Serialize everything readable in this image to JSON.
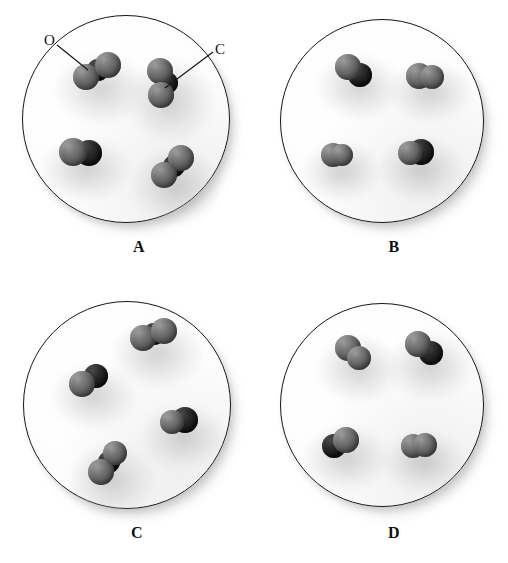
{
  "figure": {
    "type": "molecular-model-diagram",
    "background_color": "#ffffff",
    "vessel_border_color": "#16161a",
    "atom_colors": {
      "O": "#6e6e6e",
      "C": "#141414"
    },
    "atom_legend": [
      {
        "key": "O",
        "label": "O",
        "element": "oxygen",
        "color": "#6e6e6e"
      },
      {
        "key": "C",
        "label": "C",
        "element": "carbon",
        "color": "#141414"
      }
    ],
    "panels": [
      {
        "id": "A",
        "label": "A",
        "label_x": 124,
        "label_y": 238,
        "circle": {
          "cx": 125,
          "cy": 118,
          "r": 103
        },
        "callouts": [
          {
            "id": "callout-o",
            "text": "O",
            "text_x": 44,
            "text_y": 32,
            "line": {
              "x1": 57,
              "y1": 45,
              "x2": 88,
              "y2": 70
            }
          },
          {
            "id": "callout-c",
            "text": "C",
            "text_x": 215,
            "text_y": 41,
            "line": {
              "x1": 213,
              "y1": 52,
              "x2": 165,
              "y2": 88
            }
          }
        ],
        "molecules": [
          {
            "id": "A1",
            "formula": "CO2",
            "x": 72,
            "y": 52,
            "w": 50,
            "h": 42,
            "atoms": [
              {
                "el": "O",
                "cx": 14,
                "cy": 25,
                "r": 13
              },
              {
                "el": "C",
                "cx": 26,
                "cy": 18,
                "r": 11
              },
              {
                "el": "O",
                "cx": 36,
                "cy": 13,
                "r": 13
              }
            ]
          },
          {
            "id": "A2",
            "formula": "CO2",
            "x": 143,
            "y": 58,
            "w": 46,
            "h": 54,
            "atoms": [
              {
                "el": "O",
                "cx": 17,
                "cy": 13,
                "r": 13
              },
              {
                "el": "C",
                "cx": 24,
                "cy": 25,
                "r": 11
              },
              {
                "el": "O",
                "cx": 18,
                "cy": 37,
                "r": 13
              }
            ]
          },
          {
            "id": "A3",
            "formula": "CO",
            "x": 58,
            "y": 136,
            "w": 48,
            "h": 34,
            "atoms": [
              {
                "el": "O",
                "cx": 15,
                "cy": 16,
                "r": 14
              },
              {
                "el": "C",
                "cx": 31,
                "cy": 17,
                "r": 13
              }
            ]
          },
          {
            "id": "A4",
            "formula": "CO2",
            "x": 148,
            "y": 146,
            "w": 48,
            "h": 48,
            "atoms": [
              {
                "el": "O",
                "cx": 16,
                "cy": 29,
                "r": 13
              },
              {
                "el": "C",
                "cx": 26,
                "cy": 20,
                "r": 11
              },
              {
                "el": "O",
                "cx": 33,
                "cy": 12,
                "r": 13
              }
            ]
          }
        ]
      },
      {
        "id": "B",
        "label": "B",
        "label_x": 379,
        "label_y": 238,
        "circle": {
          "cx": 381,
          "cy": 120,
          "r": 101
        },
        "callouts": [],
        "molecules": [
          {
            "id": "B1",
            "formula": "CO",
            "x": 334,
            "y": 53,
            "w": 42,
            "h": 36,
            "atoms": [
              {
                "el": "O",
                "cx": 14,
                "cy": 14,
                "r": 13
              },
              {
                "el": "C",
                "cx": 26,
                "cy": 22,
                "r": 12
              }
            ]
          },
          {
            "id": "B2",
            "formula": "O2",
            "x": 405,
            "y": 60,
            "w": 42,
            "h": 32,
            "atoms": [
              {
                "el": "O",
                "cx": 14,
                "cy": 16,
                "r": 13
              },
              {
                "el": "O",
                "cx": 27,
                "cy": 17,
                "r": 12
              }
            ]
          },
          {
            "id": "B3",
            "formula": "O2",
            "x": 320,
            "y": 140,
            "w": 36,
            "h": 30,
            "atoms": [
              {
                "el": "O",
                "cx": 13,
                "cy": 15,
                "r": 12
              },
              {
                "el": "O",
                "cx": 22,
                "cy": 15,
                "r": 11
              }
            ]
          },
          {
            "id": "B4",
            "formula": "CO",
            "x": 396,
            "y": 136,
            "w": 42,
            "h": 34,
            "atoms": [
              {
                "el": "O",
                "cx": 14,
                "cy": 17,
                "r": 12
              },
              {
                "el": "C",
                "cx": 25,
                "cy": 16,
                "r": 13
              }
            ]
          }
        ]
      },
      {
        "id": "C",
        "label": "C",
        "label_x": 122,
        "label_y": 524,
        "circle": {
          "cx": 126,
          "cy": 404,
          "r": 103
        },
        "callouts": [],
        "molecules": [
          {
            "id": "C1",
            "formula": "CO2",
            "x": 128,
            "y": 318,
            "w": 50,
            "h": 40,
            "atoms": [
              {
                "el": "O",
                "cx": 15,
                "cy": 20,
                "r": 13
              },
              {
                "el": "C",
                "cx": 26,
                "cy": 16,
                "r": 11
              },
              {
                "el": "O",
                "cx": 36,
                "cy": 13,
                "r": 13
              }
            ]
          },
          {
            "id": "C2",
            "formula": "CO",
            "x": 68,
            "y": 362,
            "w": 44,
            "h": 36,
            "atoms": [
              {
                "el": "O",
                "cx": 14,
                "cy": 22,
                "r": 13
              },
              {
                "el": "C",
                "cx": 28,
                "cy": 14,
                "r": 12
              }
            ]
          },
          {
            "id": "C3",
            "formula": "CO",
            "x": 158,
            "y": 404,
            "w": 44,
            "h": 34,
            "atoms": [
              {
                "el": "O",
                "cx": 14,
                "cy": 18,
                "r": 12
              },
              {
                "el": "C",
                "cx": 27,
                "cy": 16,
                "r": 13
              }
            ]
          },
          {
            "id": "C4",
            "formula": "CO2",
            "x": 86,
            "y": 442,
            "w": 44,
            "h": 46,
            "atoms": [
              {
                "el": "O",
                "cx": 15,
                "cy": 30,
                "r": 13
              },
              {
                "el": "C",
                "cx": 23,
                "cy": 20,
                "r": 11
              },
              {
                "el": "O",
                "cx": 29,
                "cy": 11,
                "r": 12
              }
            ]
          }
        ]
      },
      {
        "id": "D",
        "label": "D",
        "label_x": 379,
        "label_y": 524,
        "circle": {
          "cx": 381,
          "cy": 404,
          "r": 101
        },
        "callouts": [],
        "molecules": [
          {
            "id": "D1",
            "formula": "O2",
            "x": 334,
            "y": 334,
            "w": 42,
            "h": 38,
            "atoms": [
              {
                "el": "O",
                "cx": 14,
                "cy": 14,
                "r": 13
              },
              {
                "el": "O",
                "cx": 25,
                "cy": 24,
                "r": 12
              }
            ]
          },
          {
            "id": "D2",
            "formula": "CO",
            "x": 404,
            "y": 330,
            "w": 44,
            "h": 40,
            "atoms": [
              {
                "el": "O",
                "cx": 14,
                "cy": 14,
                "r": 13
              },
              {
                "el": "C",
                "cx": 27,
                "cy": 23,
                "r": 12
              }
            ]
          },
          {
            "id": "D3",
            "formula": "CO",
            "x": 320,
            "y": 424,
            "w": 44,
            "h": 36,
            "atoms": [
              {
                "el": "C",
                "cx": 14,
                "cy": 22,
                "r": 12
              },
              {
                "el": "O",
                "cx": 26,
                "cy": 16,
                "r": 13
              }
            ]
          },
          {
            "id": "D4",
            "formula": "O2",
            "x": 400,
            "y": 430,
            "w": 40,
            "h": 32,
            "atoms": [
              {
                "el": "O",
                "cx": 13,
                "cy": 16,
                "r": 12
              },
              {
                "el": "O",
                "cx": 25,
                "cy": 15,
                "r": 12
              }
            ]
          }
        ]
      }
    ]
  }
}
